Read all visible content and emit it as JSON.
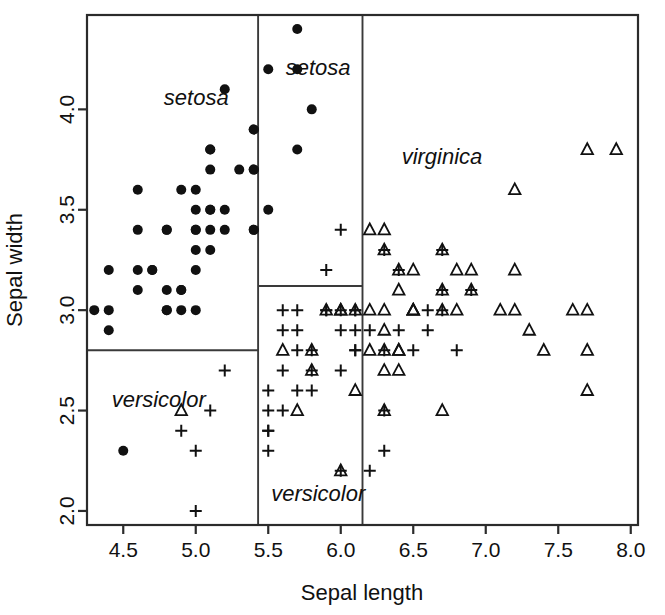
{
  "chart_data": {
    "type": "scatter",
    "title": "",
    "xlabel": "Sepal length",
    "ylabel": "Sepal width",
    "xlim": [
      4.25,
      8.05
    ],
    "ylim": [
      1.93,
      4.47
    ],
    "xticks": [
      4.5,
      5.0,
      5.5,
      6.0,
      6.5,
      7.0,
      7.5,
      8.0
    ],
    "xticklabels": [
      "4.5",
      "5.0",
      "5.5",
      "6.0",
      "6.5",
      "7.0",
      "7.5",
      "8.0"
    ],
    "yticks": [
      2.0,
      2.5,
      3.0,
      3.5,
      4.0
    ],
    "yticklabels": [
      "2.0",
      "2.5",
      "3.0",
      "3.5",
      "4.0"
    ],
    "grid": false,
    "legend": "none",
    "marker_map": {
      "setosa": "filled-circle",
      "versicolor": "plus",
      "virginica": "open-triangle"
    },
    "annotations": [
      {
        "text": "setosa",
        "x": 4.78,
        "y": 4.02,
        "style": "italic"
      },
      {
        "text": "setosa",
        "x": 5.62,
        "y": 4.17,
        "style": "italic"
      },
      {
        "text": "virginica",
        "x": 6.42,
        "y": 3.73,
        "style": "italic"
      },
      {
        "text": "versicolor",
        "x": 4.42,
        "y": 2.52,
        "style": "italic"
      },
      {
        "text": "versicolor",
        "x": 5.52,
        "y": 2.05,
        "style": "italic"
      }
    ],
    "partitions": {
      "vertical_lines": [
        {
          "x": 5.43,
          "y0": 1.93,
          "y1": 4.47
        },
        {
          "x": 6.15,
          "y0": 1.93,
          "y1": 4.47
        }
      ],
      "horizontal_lines": [
        {
          "y": 2.8,
          "x0": 4.25,
          "x1": 5.43
        },
        {
          "y": 3.12,
          "x0": 5.43,
          "x1": 6.15
        }
      ]
    },
    "series": [
      {
        "name": "setosa",
        "marker": "filled-circle",
        "points": [
          [
            4.3,
            3.0
          ],
          [
            4.4,
            2.9
          ],
          [
            4.4,
            3.0
          ],
          [
            4.4,
            3.2
          ],
          [
            4.5,
            2.3
          ],
          [
            4.6,
            3.1
          ],
          [
            4.6,
            3.4
          ],
          [
            4.6,
            3.6
          ],
          [
            4.6,
            3.2
          ],
          [
            4.7,
            3.2
          ],
          [
            4.7,
            3.2
          ],
          [
            4.8,
            3.0
          ],
          [
            4.8,
            3.1
          ],
          [
            4.8,
            3.4
          ],
          [
            4.8,
            3.4
          ],
          [
            4.8,
            3.0
          ],
          [
            4.9,
            3.0
          ],
          [
            4.9,
            3.1
          ],
          [
            4.9,
            3.6
          ],
          [
            4.9,
            3.1
          ],
          [
            5.0,
            3.0
          ],
          [
            5.0,
            3.2
          ],
          [
            5.0,
            3.5
          ],
          [
            5.0,
            3.6
          ],
          [
            5.0,
            3.4
          ],
          [
            5.0,
            3.4
          ],
          [
            5.0,
            3.3
          ],
          [
            5.1,
            3.5
          ],
          [
            5.1,
            3.5
          ],
          [
            5.1,
            3.4
          ],
          [
            5.1,
            3.8
          ],
          [
            5.1,
            3.7
          ],
          [
            5.1,
            3.3
          ],
          [
            5.1,
            3.8
          ],
          [
            5.2,
            3.5
          ],
          [
            5.2,
            3.4
          ],
          [
            5.2,
            4.1
          ],
          [
            5.3,
            3.7
          ],
          [
            5.4,
            3.9
          ],
          [
            5.4,
            3.7
          ],
          [
            5.4,
            3.4
          ],
          [
            5.4,
            3.9
          ],
          [
            5.4,
            3.4
          ],
          [
            5.5,
            3.5
          ],
          [
            5.5,
            4.2
          ],
          [
            5.7,
            4.4
          ],
          [
            5.7,
            3.8
          ],
          [
            5.8,
            4.0
          ],
          [
            5.7,
            4.2
          ],
          [
            5.4,
            3.7
          ]
        ]
      },
      {
        "name": "versicolor",
        "marker": "plus",
        "points": [
          [
            4.9,
            2.4
          ],
          [
            5.0,
            2.0
          ],
          [
            5.0,
            2.3
          ],
          [
            5.1,
            2.5
          ],
          [
            5.2,
            2.7
          ],
          [
            5.5,
            2.3
          ],
          [
            5.5,
            2.4
          ],
          [
            5.5,
            2.4
          ],
          [
            5.5,
            2.5
          ],
          [
            5.5,
            2.6
          ],
          [
            5.6,
            2.5
          ],
          [
            5.6,
            2.9
          ],
          [
            5.6,
            3.0
          ],
          [
            5.6,
            2.7
          ],
          [
            5.7,
            2.6
          ],
          [
            5.7,
            2.8
          ],
          [
            5.7,
            2.9
          ],
          [
            5.7,
            3.0
          ],
          [
            5.8,
            2.6
          ],
          [
            5.8,
            2.7
          ],
          [
            5.9,
            3.0
          ],
          [
            5.9,
            3.2
          ],
          [
            6.0,
            2.2
          ],
          [
            6.0,
            2.7
          ],
          [
            6.0,
            2.9
          ],
          [
            6.0,
            3.4
          ],
          [
            6.1,
            2.8
          ],
          [
            6.1,
            2.8
          ],
          [
            6.1,
            2.9
          ],
          [
            6.1,
            3.0
          ],
          [
            6.2,
            2.2
          ],
          [
            6.2,
            2.9
          ],
          [
            6.3,
            2.3
          ],
          [
            6.3,
            2.5
          ],
          [
            6.3,
            2.8
          ],
          [
            6.4,
            2.9
          ],
          [
            6.5,
            2.8
          ],
          [
            6.6,
            2.9
          ],
          [
            6.6,
            3.0
          ],
          [
            6.7,
            3.0
          ],
          [
            6.7,
            3.1
          ],
          [
            6.8,
            2.8
          ],
          [
            6.9,
            3.1
          ],
          [
            5.8,
            2.8
          ],
          [
            6.0,
            3.0
          ],
          [
            6.3,
            3.3
          ],
          [
            6.7,
            3.3
          ],
          [
            5.9,
            3.0
          ],
          [
            6.1,
            3.0
          ],
          [
            6.4,
            3.2
          ]
        ]
      },
      {
        "name": "virginica",
        "marker": "open-triangle",
        "points": [
          [
            4.9,
            2.5
          ],
          [
            5.6,
            2.8
          ],
          [
            5.7,
            2.5
          ],
          [
            5.8,
            2.7
          ],
          [
            5.8,
            2.8
          ],
          [
            5.9,
            3.0
          ],
          [
            6.0,
            2.2
          ],
          [
            6.0,
            3.0
          ],
          [
            6.1,
            2.6
          ],
          [
            6.2,
            2.8
          ],
          [
            6.2,
            3.4
          ],
          [
            6.3,
            2.5
          ],
          [
            6.3,
            2.7
          ],
          [
            6.3,
            2.8
          ],
          [
            6.3,
            2.9
          ],
          [
            6.3,
            3.3
          ],
          [
            6.3,
            3.4
          ],
          [
            6.4,
            2.7
          ],
          [
            6.4,
            2.8
          ],
          [
            6.4,
            2.8
          ],
          [
            6.4,
            3.1
          ],
          [
            6.4,
            3.2
          ],
          [
            6.5,
            3.0
          ],
          [
            6.5,
            3.0
          ],
          [
            6.5,
            3.2
          ],
          [
            6.5,
            3.0
          ],
          [
            6.7,
            2.5
          ],
          [
            6.7,
            3.0
          ],
          [
            6.7,
            3.1
          ],
          [
            6.7,
            3.3
          ],
          [
            6.8,
            3.0
          ],
          [
            6.8,
            3.2
          ],
          [
            6.9,
            3.1
          ],
          [
            6.9,
            3.2
          ],
          [
            7.1,
            3.0
          ],
          [
            7.2,
            3.0
          ],
          [
            7.2,
            3.2
          ],
          [
            7.2,
            3.6
          ],
          [
            7.3,
            2.9
          ],
          [
            7.4,
            2.8
          ],
          [
            7.6,
            3.0
          ],
          [
            7.7,
            2.6
          ],
          [
            7.7,
            2.8
          ],
          [
            7.7,
            3.0
          ],
          [
            7.7,
            3.8
          ],
          [
            7.9,
            3.8
          ],
          [
            6.1,
            3.0
          ],
          [
            6.0,
            3.0
          ],
          [
            6.2,
            3.0
          ],
          [
            6.3,
            3.0
          ]
        ]
      }
    ]
  }
}
